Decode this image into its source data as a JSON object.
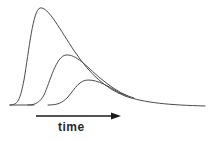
{
  "diagram": {
    "axis_label": "time",
    "arrow_direction": "right",
    "colors": {
      "curve": "#4a4a4a",
      "arrow": "#1a1a1a",
      "text": "#2a2a2a",
      "background": "#ffffff"
    },
    "curves": [
      {
        "name": "curve-tall",
        "peak_x": 40,
        "peak_y": 8
      },
      {
        "name": "curve-medium",
        "peak_x": 66,
        "peak_y": 55
      },
      {
        "name": "curve-short",
        "peak_x": 88,
        "peak_y": 80
      }
    ]
  }
}
